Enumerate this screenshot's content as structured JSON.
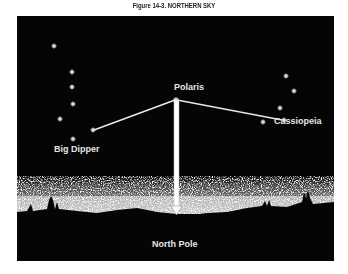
{
  "figure": {
    "title": "Figure 14-3. NORTHERN SKY",
    "labels": {
      "polaris": "Polaris",
      "big_dipper": "Big Dipper",
      "cassiopeia": "Cassiopeia",
      "north_pole": "North Pole"
    },
    "colors": {
      "sky": "#050505",
      "stars": "#ffffff",
      "lines": "#e8e8e8",
      "label_text": "#e6e6e6"
    },
    "stars": {
      "big_dipper": [
        [
          37,
          30
        ],
        [
          55,
          56
        ],
        [
          55,
          71
        ],
        [
          56,
          88
        ],
        [
          43,
          103
        ],
        [
          76,
          114
        ],
        [
          56,
          123
        ]
      ],
      "polaris": [
        159,
        84
      ],
      "cassiopeia": [
        [
          269,
          60
        ],
        [
          277,
          75
        ],
        [
          263,
          92
        ],
        [
          267,
          104
        ],
        [
          246,
          106
        ]
      ]
    }
  }
}
